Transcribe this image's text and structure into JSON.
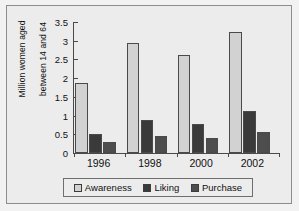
{
  "chart_data": {
    "type": "bar",
    "title": "",
    "subtitle": "",
    "xlabel": "",
    "ylabel": "Million women aged between 14 and 64",
    "ylabel_line1": "Million women aged",
    "ylabel_line2": "between 14 and 64",
    "categories": [
      "1996",
      "1998",
      "2000",
      "2002"
    ],
    "series": [
      {
        "name": "Awareness",
        "color": "#d2d2d2",
        "values": [
          1.88,
          2.93,
          2.62,
          3.22
        ]
      },
      {
        "name": "Liking",
        "color": "#3a3a3a",
        "values": [
          0.5,
          0.89,
          0.78,
          1.11
        ]
      },
      {
        "name": "Purchase",
        "color": "#4d4d4d",
        "values": [
          0.3,
          0.45,
          0.4,
          0.56
        ]
      }
    ],
    "ylim": [
      0,
      3.5
    ],
    "yticks": [
      0,
      0.5,
      1,
      1.5,
      2,
      2.5,
      3,
      3.5
    ],
    "ytick_labels": [
      "0",
      "0.5",
      "1",
      "1.5",
      "2",
      "2.5",
      "3",
      "3.5"
    ],
    "grid": false,
    "legend_position": "bottom"
  },
  "legend": {
    "items": [
      {
        "label": "Awareness",
        "color": "#d2d2d2"
      },
      {
        "label": "Liking",
        "color": "#3a3a3a"
      },
      {
        "label": "Purchase",
        "color": "#4d4d4d"
      }
    ]
  },
  "colors": {
    "background": "#f2f2f2",
    "panel": "#ececec",
    "axis": "#4a4a4a",
    "frame": "#8d8d8d",
    "text": "#111111"
  }
}
